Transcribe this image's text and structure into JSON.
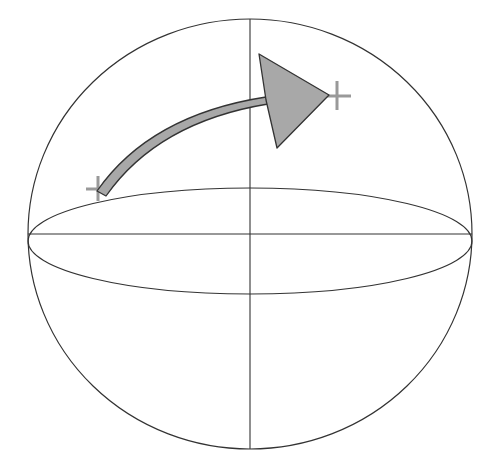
{
  "diagram": {
    "type": "sphere-rotation",
    "colors": {
      "background": "#ffffff",
      "outline": "#333333",
      "arrow_fill": "#a8a8a8",
      "arrow_stroke": "#333333",
      "marker": "#999999"
    },
    "sphere": {
      "cx": 250,
      "cy": 234,
      "rx": 222,
      "ry": 215
    },
    "equator": {
      "cx": 250,
      "cy": 241,
      "rx": 222,
      "ry": 53
    },
    "axes": {
      "horizontal": {
        "x1": 28,
        "y1": 234,
        "x2": 472,
        "y2": 234
      },
      "vertical": {
        "x1": 250,
        "y1": 19,
        "x2": 250,
        "y2": 449
      }
    },
    "markers": [
      {
        "name": "start-point",
        "x": 98,
        "y": 189
      },
      {
        "name": "end-point",
        "x": 337,
        "y": 96
      }
    ],
    "arrow": {
      "from": [
        102,
        193
      ],
      "to": [
        268,
        101
      ],
      "head": [
        [
          259,
          54
        ],
        [
          329,
          95
        ],
        [
          277,
          148
        ]
      ]
    }
  }
}
